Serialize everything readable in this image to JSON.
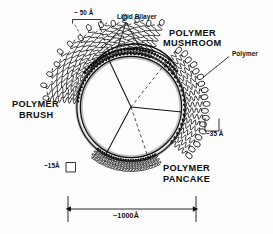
{
  "figure": {
    "title_alt": "Liposome surface polymer conformation regimes",
    "background_color": "#fdfdfd",
    "ink_color": "#0d0d0d",
    "membrane_shade_color": "#b8b8b8"
  },
  "labels": {
    "lipid_bilayer": "Lipid Bilayer",
    "polymer_mushroom_line1": "POLYMER",
    "polymer_mushroom_line2": "MUSHROOM",
    "polymer_brush_line1": "POLYMER",
    "polymer_brush_line2": "BRUSH",
    "polymer_pancake_line1": "POLYMER",
    "polymer_pancake_line2": "PANCAKE",
    "polymer_callout": "Polymer"
  },
  "dimensions": {
    "brush_thickness": "~ 50 Å",
    "mushroom_thickness": "~35 Å",
    "pancake_thickness": "~15Å",
    "vesicle_diameter": "~1000Å"
  },
  "regions": [
    {
      "name": "polymer-brush",
      "label": "POLYMER BRUSH",
      "thickness": "~ 50 Å"
    },
    {
      "name": "polymer-mushroom",
      "label": "POLYMER MUSHROOM",
      "thickness": "~35 Å"
    },
    {
      "name": "polymer-pancake",
      "label": "POLYMER PANCAKE",
      "thickness": "~15Å"
    }
  ]
}
